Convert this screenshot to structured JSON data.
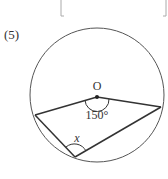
{
  "problem": {
    "number": "(5)",
    "center_label": "O",
    "central_angle_label": "150°",
    "unknown_label": "x"
  },
  "colors": {
    "stroke": "#333333",
    "bracket": "#aaaaaa",
    "text": "#333333"
  }
}
